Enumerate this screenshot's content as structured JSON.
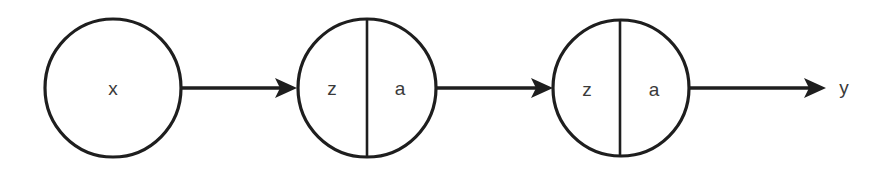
{
  "diagram": {
    "type": "neural-network-chain",
    "nodes": [
      {
        "id": "input",
        "label": "x",
        "split": false
      },
      {
        "id": "layer1",
        "left_label": "z",
        "right_label": "a",
        "split": true
      },
      {
        "id": "layer2",
        "left_label": "z",
        "right_label": "a",
        "split": true
      }
    ],
    "edges": [
      {
        "from": "input",
        "to": "layer1"
      },
      {
        "from": "layer1",
        "to": "layer2"
      },
      {
        "from": "layer2",
        "to": "output"
      }
    ],
    "output_label": "y",
    "colors": {
      "stroke": "#1e1e1e",
      "text": "#3a3a3a",
      "background": "#ffffff"
    }
  }
}
